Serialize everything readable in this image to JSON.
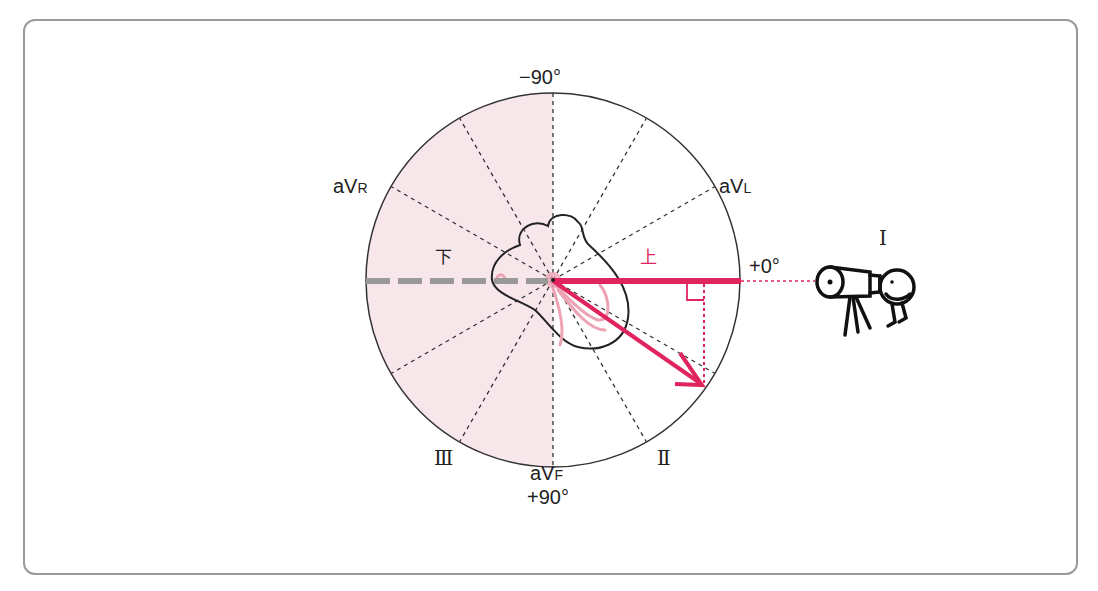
{
  "diagram": {
    "angles": {
      "top": "−90°",
      "right": "+0°",
      "bottom": "+90°"
    },
    "leads": {
      "aVR": {
        "main": "aV",
        "sub": "R"
      },
      "aVL": {
        "main": "aV",
        "sub": "L"
      },
      "aVF": {
        "main": "aV",
        "sub": "F"
      },
      "I": "I",
      "II": "Ⅱ",
      "III": "Ⅲ"
    },
    "direction_labels": {
      "up": "上",
      "down": "下"
    },
    "observer": "telescope-observer",
    "colors": {
      "vector": "#e0245e",
      "negative_half_fill": "#f7e6ea",
      "negative_axis": "#999999",
      "outline": "#222222",
      "frame": "#9a9a9a",
      "heart_conduction": "#eea3b4"
    }
  }
}
